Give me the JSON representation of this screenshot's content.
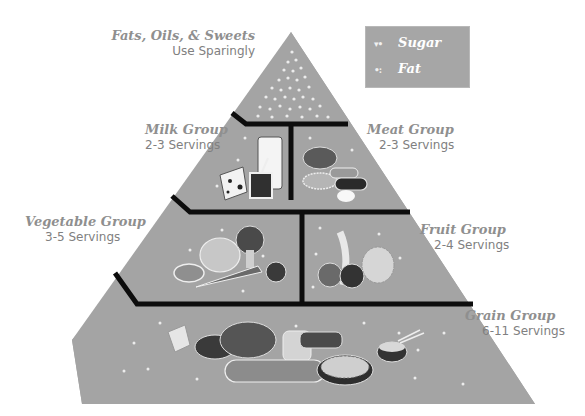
{
  "diagram": {
    "colors": {
      "pyramid_fill": "#a4a4a4",
      "divider": "#0d0d0d",
      "label_text": "#8a8a8a",
      "dot": "#e8e8e8",
      "legend_fill": "#a6a6a6"
    }
  },
  "legend": {
    "items": [
      {
        "symbol": "sugar-dot-icon",
        "glyph": "▾•",
        "label": "Sugar"
      },
      {
        "symbol": "fat-dot-icon",
        "glyph": "•:",
        "label": "Fat"
      }
    ]
  },
  "groups": [
    {
      "id": "fats",
      "title": "Fats, Oils, & Sweets",
      "servings": "Use Sparingly",
      "tier": 1
    },
    {
      "id": "milk",
      "title": "Milk Group",
      "servings": "2-3 Servings",
      "tier": 2
    },
    {
      "id": "meat",
      "title": "Meat Group",
      "servings": "2-3 Servings",
      "tier": 2
    },
    {
      "id": "vegetable",
      "title": "Vegetable Group",
      "servings": "3-5 Servings",
      "tier": 3
    },
    {
      "id": "fruit",
      "title": "Fruit Group",
      "servings": "2-4 Servings",
      "tier": 3
    },
    {
      "id": "grain",
      "title": "Grain Group",
      "servings": "6-11 Servings",
      "tier": 4
    }
  ],
  "illustrations": {
    "milk": [
      "glass-of-milk",
      "cheese",
      "yogurt-cup"
    ],
    "meat": [
      "chicken",
      "beans",
      "fish",
      "steak",
      "egg"
    ],
    "vegetable": [
      "potato",
      "lettuce",
      "broccoli",
      "carrot",
      "tomato"
    ],
    "fruit": [
      "orange",
      "banana",
      "apple",
      "grapes"
    ],
    "grain": [
      "crackers",
      "cereal-bowl",
      "bread-loaf",
      "sliced-bread",
      "baguette",
      "pasta-plate",
      "rice-bowl"
    ]
  }
}
